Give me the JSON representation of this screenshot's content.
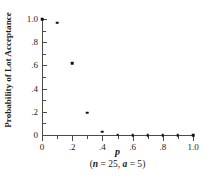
{
  "chart_data": {
    "type": "scatter",
    "title": "",
    "xlabel": "p",
    "xlabel_note": "(n = 25, a = 5)",
    "ylabel": "Probability of Lot Acceptance",
    "xlim": [
      0.0,
      1.0
    ],
    "ylim": [
      0.0,
      1.0
    ],
    "grid": false,
    "legend": "none",
    "x_ticks": [
      0.0,
      0.1,
      0.2,
      0.3,
      0.4,
      0.5,
      0.6,
      0.7,
      0.8,
      0.9,
      1.0
    ],
    "x_tick_labels": [
      "0",
      "",
      ".2",
      "",
      ".4",
      "",
      ".6",
      "",
      ".8",
      "",
      "1.0"
    ],
    "y_ticks": [
      0.0,
      0.1,
      0.2,
      0.3,
      0.4,
      0.5,
      0.6,
      0.7,
      0.8,
      0.9,
      1.0
    ],
    "y_tick_labels": [
      "0",
      "",
      ".2",
      "",
      ".4",
      "",
      ".6",
      "",
      ".8",
      "",
      "1.0"
    ],
    "marker": "square-dot",
    "marker_color": "#111111",
    "x": [
      0.0,
      0.1,
      0.2,
      0.3,
      0.4,
      0.5,
      0.6,
      0.7,
      0.8,
      0.9,
      1.0
    ],
    "y": [
      1.0,
      0.967,
      0.617,
      0.193,
      0.03,
      0.002,
      0.0,
      0.0,
      0.0,
      0.0,
      0.0
    ],
    "points": [
      {
        "x": 0.0,
        "y": 1.0
      },
      {
        "x": 0.1,
        "y": 0.967
      },
      {
        "x": 0.2,
        "y": 0.617
      },
      {
        "x": 0.3,
        "y": 0.193
      },
      {
        "x": 0.4,
        "y": 0.03
      },
      {
        "x": 0.5,
        "y": 0.002
      },
      {
        "x": 0.6,
        "y": 0.0
      },
      {
        "x": 0.7,
        "y": 0.0
      },
      {
        "x": 0.8,
        "y": 0.0
      },
      {
        "x": 0.9,
        "y": 0.0
      },
      {
        "x": 1.0,
        "y": 0.0
      }
    ]
  },
  "figure": {
    "ylabel_text": "Probability of Lot Acceptance",
    "xlabel_symbol": "p",
    "caption_open": "(",
    "caption_n_var": "n",
    "caption_n_eq": " = 25, ",
    "caption_a_var": "a",
    "caption_a_eq": " = 5",
    "caption_close": ")",
    "background_color": "#ffffff",
    "axis_color": "#4a4a4a",
    "text_color": "#1a1a1a"
  }
}
